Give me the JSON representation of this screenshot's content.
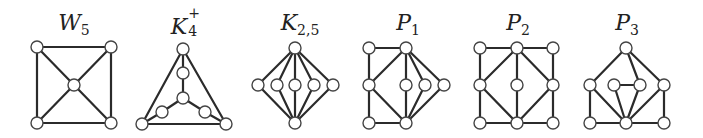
{
  "figure": {
    "colors": {
      "edge": "#2b2b2b",
      "node_fill": "#ffffff",
      "node_stroke": "#444444",
      "label": "#222222",
      "background": "#ffffff"
    },
    "node_radius": 6,
    "graphs": [
      {
        "id": "W5",
        "label_main": "W",
        "label_sub": "5",
        "label_sup": "",
        "label_x": 74,
        "label_y": 12,
        "nodes": {
          "tl": [
            37,
            47
          ],
          "tr": [
            111,
            47
          ],
          "c": [
            74,
            85
          ],
          "bl": [
            37,
            123
          ],
          "br": [
            111,
            123
          ]
        },
        "edges": [
          [
            "tl",
            "tr"
          ],
          [
            "tr",
            "br"
          ],
          [
            "br",
            "bl"
          ],
          [
            "bl",
            "tl"
          ],
          [
            "tl",
            "c"
          ],
          [
            "tr",
            "c"
          ],
          [
            "bl",
            "c"
          ],
          [
            "br",
            "c"
          ]
        ]
      },
      {
        "id": "K4+",
        "label_main": "K",
        "label_sub": "4",
        "label_sup": "+",
        "label_x": 184,
        "label_y": 12,
        "nodes": {
          "top": [
            183,
            49
          ],
          "mu": [
            183,
            73
          ],
          "c": [
            183,
            98
          ],
          "ll": [
            162,
            112
          ],
          "lr": [
            205,
            112
          ],
          "bl": [
            142,
            124
          ],
          "br": [
            226,
            124
          ]
        },
        "edges": [
          [
            "top",
            "bl"
          ],
          [
            "top",
            "br"
          ],
          [
            "bl",
            "br"
          ],
          [
            "top",
            "mu"
          ],
          [
            "mu",
            "c"
          ],
          [
            "c",
            "ll"
          ],
          [
            "ll",
            "bl"
          ],
          [
            "c",
            "lr"
          ],
          [
            "lr",
            "br"
          ]
        ]
      },
      {
        "id": "K2,5",
        "label_main": "K",
        "label_sub": "2,5",
        "label_sup": "",
        "label_x": 300,
        "label_y": 12,
        "nodes": {
          "top": [
            295,
            48
          ],
          "bot": [
            295,
            123
          ],
          "m1": [
            258,
            85
          ],
          "m2": [
            277,
            85
          ],
          "m3": [
            295,
            85
          ],
          "m4": [
            314,
            85
          ],
          "m5": [
            333,
            85
          ]
        },
        "edges": [
          [
            "top",
            "m1"
          ],
          [
            "top",
            "m2"
          ],
          [
            "top",
            "m3"
          ],
          [
            "top",
            "m4"
          ],
          [
            "top",
            "m5"
          ],
          [
            "bot",
            "m1"
          ],
          [
            "bot",
            "m2"
          ],
          [
            "bot",
            "m3"
          ],
          [
            "bot",
            "m4"
          ],
          [
            "bot",
            "m5"
          ]
        ]
      },
      {
        "id": "P1",
        "label_main": "P",
        "label_sub": "1",
        "label_sup": "",
        "label_x": 408,
        "label_y": 12,
        "nodes": {
          "tl": [
            369,
            48
          ],
          "tm": [
            406,
            48
          ],
          "ml": [
            369,
            85
          ],
          "mm": [
            406,
            85
          ],
          "m3": [
            425,
            85
          ],
          "m4": [
            444,
            85
          ],
          "bl": [
            369,
            123
          ],
          "bm": [
            406,
            123
          ]
        },
        "edges": [
          [
            "tl",
            "tm"
          ],
          [
            "tl",
            "ml"
          ],
          [
            "ml",
            "bl"
          ],
          [
            "bl",
            "bm"
          ],
          [
            "tm",
            "ml"
          ],
          [
            "ml",
            "bm"
          ],
          [
            "tm",
            "mm"
          ],
          [
            "mm",
            "bm"
          ],
          [
            "tm",
            "m3"
          ],
          [
            "m3",
            "bm"
          ],
          [
            "tm",
            "m4"
          ],
          [
            "m4",
            "bm"
          ]
        ]
      },
      {
        "id": "P2",
        "label_main": "P",
        "label_sub": "2",
        "label_sup": "",
        "label_x": 518,
        "label_y": 12,
        "nodes": {
          "tl": [
            480,
            48
          ],
          "tm": [
            517,
            48
          ],
          "tr": [
            553,
            48
          ],
          "ml": [
            480,
            85
          ],
          "mm": [
            517,
            85
          ],
          "mr": [
            553,
            85
          ],
          "bl": [
            480,
            123
          ],
          "bm": [
            517,
            123
          ],
          "br": [
            553,
            123
          ]
        },
        "edges": [
          [
            "tl",
            "tm"
          ],
          [
            "tm",
            "tr"
          ],
          [
            "tl",
            "ml"
          ],
          [
            "ml",
            "bl"
          ],
          [
            "tr",
            "mr"
          ],
          [
            "mr",
            "br"
          ],
          [
            "bl",
            "bm"
          ],
          [
            "bm",
            "br"
          ],
          [
            "tm",
            "ml"
          ],
          [
            "tm",
            "mm"
          ],
          [
            "tm",
            "mr"
          ],
          [
            "ml",
            "bm"
          ],
          [
            "mm",
            "bm"
          ],
          [
            "mr",
            "bm"
          ]
        ]
      },
      {
        "id": "P3",
        "label_main": "P",
        "label_sub": "3",
        "label_sup": "",
        "label_x": 627,
        "label_y": 12,
        "nodes": {
          "top": [
            626,
            48
          ],
          "l": [
            590,
            85
          ],
          "il": [
            614,
            85
          ],
          "ir": [
            640,
            85
          ],
          "r": [
            664,
            85
          ],
          "bl": [
            590,
            123
          ],
          "bm": [
            626,
            123
          ],
          "br": [
            664,
            123
          ]
        },
        "edges": [
          [
            "top",
            "l"
          ],
          [
            "top",
            "ir"
          ],
          [
            "top",
            "r"
          ],
          [
            "l",
            "bl"
          ],
          [
            "l",
            "bm"
          ],
          [
            "il",
            "ir"
          ],
          [
            "il",
            "bm"
          ],
          [
            "ir",
            "bm"
          ],
          [
            "r",
            "bm"
          ],
          [
            "r",
            "br"
          ],
          [
            "bl",
            "bm"
          ],
          [
            "bm",
            "br"
          ]
        ]
      }
    ]
  }
}
